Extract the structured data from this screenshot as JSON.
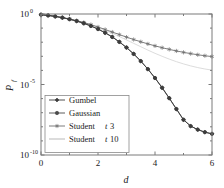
{
  "chart_data": {
    "type": "line",
    "title": "",
    "xlabel": "d",
    "ylabel": "P_f",
    "ylabel_display": "P",
    "ylabel_sub": "f",
    "xlim": [
      0,
      6
    ],
    "ylim_log10": [
      -10,
      0
    ],
    "yscale": "log",
    "grid": false,
    "legend_position": "lower-left-inside",
    "xticks": [
      0,
      2,
      4,
      6
    ],
    "xtick_labels": [
      "0",
      "2",
      "4",
      "6"
    ],
    "yticks_log10": [
      0,
      -5,
      -10
    ],
    "ytick_labels": [
      "10",
      "10",
      "10"
    ],
    "ytick_exponents": [
      "0",
      "-5",
      "-10"
    ],
    "series": [
      {
        "name": "Gumbel",
        "label": "Gumbel",
        "color": "#3c3c3c",
        "marker": "diamond",
        "x": [
          0,
          0.25,
          0.5,
          0.75,
          1,
          1.25,
          1.5,
          1.75,
          2,
          2.25,
          2.5,
          2.75,
          3,
          3.25,
          3.5,
          3.75,
          4,
          4.25,
          4.5,
          4.75,
          5,
          5.25,
          5.5,
          5.75,
          6
        ],
        "y_log10": [
          -0.05,
          -0.1,
          -0.17,
          -0.26,
          -0.37,
          -0.5,
          -0.66,
          -0.85,
          -1.07,
          -1.33,
          -1.63,
          -1.98,
          -2.38,
          -2.83,
          -3.34,
          -3.91,
          -4.54,
          -5.23,
          -5.97,
          -6.74,
          -7.5,
          -7.95,
          -8.2,
          -8.38,
          -8.5
        ]
      },
      {
        "name": "Gaussian",
        "label": "Gaussian",
        "color": "#4a4a4a",
        "marker": "circle",
        "x": [
          0,
          0.25,
          0.5,
          0.75,
          1,
          1.25,
          1.5,
          1.75,
          2,
          2.25,
          2.5,
          2.75,
          3,
          3.25,
          3.5,
          3.75,
          4,
          4.25,
          4.5,
          4.75,
          5,
          5.25,
          5.5,
          5.75,
          6
        ],
        "y_log10": [
          -0.05,
          -0.1,
          -0.17,
          -0.26,
          -0.37,
          -0.5,
          -0.66,
          -0.85,
          -1.07,
          -1.33,
          -1.63,
          -1.98,
          -2.38,
          -2.83,
          -3.34,
          -3.91,
          -4.54,
          -5.23,
          -5.97,
          -6.74,
          -7.5,
          -7.95,
          -8.2,
          -8.38,
          -8.5
        ]
      },
      {
        "name": "Student t 3",
        "label_prefix": "Student",
        "label_italic": "t",
        "label_suffix": "3",
        "color": "#6e6e6e",
        "marker": "star",
        "x": [
          0,
          0.25,
          0.5,
          0.75,
          1,
          1.25,
          1.5,
          1.75,
          2,
          2.25,
          2.5,
          2.75,
          3,
          3.25,
          3.5,
          3.75,
          4,
          4.25,
          4.5,
          4.75,
          5,
          5.25,
          5.5,
          5.75,
          6
        ],
        "y_log10": [
          -0.05,
          -0.1,
          -0.17,
          -0.25,
          -0.35,
          -0.47,
          -0.6,
          -0.75,
          -0.92,
          -1.1,
          -1.28,
          -1.46,
          -1.64,
          -1.81,
          -1.97,
          -2.12,
          -2.26,
          -2.39,
          -2.51,
          -2.62,
          -2.72,
          -2.81,
          -2.89,
          -2.96,
          -3.02
        ]
      },
      {
        "name": "Student t 10",
        "label_prefix": "Student",
        "label_italic": "t",
        "label_suffix": "10",
        "color": "#d8d8d8",
        "marker": "none",
        "x": [
          0,
          0.25,
          0.5,
          0.75,
          1,
          1.25,
          1.5,
          1.75,
          2,
          2.25,
          2.5,
          2.75,
          3,
          3.25,
          3.5,
          3.75,
          4,
          4.25,
          4.5,
          4.75,
          5,
          5.25,
          5.5,
          5.75,
          6
        ],
        "y_log10": [
          -0.05,
          -0.1,
          -0.17,
          -0.26,
          -0.36,
          -0.48,
          -0.62,
          -0.78,
          -0.96,
          -1.16,
          -1.37,
          -1.6,
          -1.84,
          -2.08,
          -2.32,
          -2.56,
          -2.79,
          -3.0,
          -3.2,
          -3.38,
          -3.54,
          -3.68,
          -3.8,
          -3.9,
          -3.98
        ]
      }
    ]
  },
  "axes": {
    "frame_color": "#7a7a7a",
    "background": "#ffffff"
  },
  "legend": {
    "entries": [
      {
        "label": "Gumbel"
      },
      {
        "label": "Gaussian"
      },
      {
        "label": "Student t 3"
      },
      {
        "label": "Student t 10"
      }
    ]
  }
}
